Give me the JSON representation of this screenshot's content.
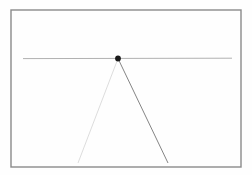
{
  "figure": {
    "title": "",
    "background_color": "#fefefe",
    "width": 252,
    "height": 175
  },
  "frame": {
    "name": "plot-frame",
    "x": 11,
    "y": 10,
    "width": 230,
    "height": 157,
    "stroke": "#8a8a8a",
    "stroke_width": 1.4,
    "fill": "none"
  },
  "chart_data": {
    "type": "scatter",
    "title": "",
    "subtitle": "",
    "xlabel": "",
    "ylabel": "",
    "xlim": [
      11,
      241
    ],
    "ylim": [
      10,
      167
    ],
    "grid": false,
    "legend": null,
    "tick_labels_x": [],
    "tick_labels_y": [],
    "annotations": [],
    "points": [
      {
        "name": "vertex-point",
        "x": 118,
        "y": 58.5,
        "radius": 2.9,
        "color": "#1a1a1a",
        "label": ""
      }
    ],
    "series": [
      {
        "name": "horizon-line",
        "type": "line",
        "x": [
          23,
          232
        ],
        "y": [
          58.6,
          58.2
        ],
        "color": "#8f8f8f",
        "width": 0.9,
        "opacity": 0.78
      },
      {
        "name": "left-ray",
        "type": "line",
        "x": [
          118,
          78
        ],
        "y": [
          58.5,
          163
        ],
        "color": "#b9b9b9",
        "width": 0.8,
        "opacity": 0.62
      },
      {
        "name": "right-ray",
        "type": "line",
        "x": [
          118,
          168
        ],
        "y": [
          58.5,
          163
        ],
        "color": "#6e6e6e",
        "width": 0.9,
        "opacity": 0.95
      }
    ]
  }
}
